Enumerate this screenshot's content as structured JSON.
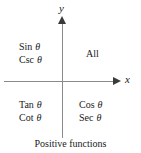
{
  "figure": {
    "caption": "Positive functions",
    "axes": {
      "x_label": "x",
      "y_label": "y",
      "line_color": "#8a8a8a",
      "arrow_color": "#3a3a3a"
    },
    "quadrants": [
      {
        "id": "quadrant-1",
        "position": "upper-right",
        "lines": [
          {
            "function": "All",
            "variable": ""
          }
        ]
      },
      {
        "id": "quadrant-2",
        "position": "upper-left",
        "lines": [
          {
            "function": "Sin",
            "variable": "θ"
          },
          {
            "function": "Csc",
            "variable": "θ"
          }
        ]
      },
      {
        "id": "quadrant-3",
        "position": "lower-left",
        "lines": [
          {
            "function": "Tan",
            "variable": "θ"
          },
          {
            "function": "Cot",
            "variable": "θ"
          }
        ]
      },
      {
        "id": "quadrant-4",
        "position": "lower-right",
        "lines": [
          {
            "function": "Cos",
            "variable": "θ"
          },
          {
            "function": "Sec",
            "variable": "θ"
          }
        ]
      }
    ]
  },
  "chart_data": {
    "type": "diagram",
    "title": "",
    "subtitle": "Positive functions",
    "xlabel": "x",
    "ylabel": "y",
    "categories": [
      "Quadrant II",
      "Quadrant I",
      "Quadrant III",
      "Quadrant IV"
    ],
    "annotations": [
      {
        "quadrant": 2,
        "text": "Sin θ / Csc θ"
      },
      {
        "quadrant": 1,
        "text": "All"
      },
      {
        "quadrant": 3,
        "text": "Tan θ / Cot θ"
      },
      {
        "quadrant": 4,
        "text": "Cos θ / Sec θ"
      }
    ],
    "grid": false,
    "legend": "none"
  }
}
